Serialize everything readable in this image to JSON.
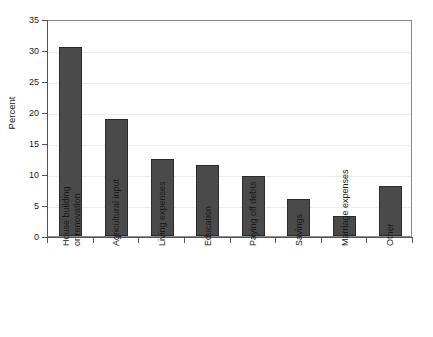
{
  "chart_data": {
    "type": "bar",
    "title": "",
    "xlabel": "",
    "ylabel": "Percent",
    "ylim": [
      0,
      35
    ],
    "yticks": [
      0,
      5,
      10,
      15,
      20,
      25,
      30,
      35
    ],
    "ytick_labels": [
      "0",
      "5",
      "10",
      "15",
      "20",
      "25",
      "30",
      "35"
    ],
    "grid": true,
    "legend": false,
    "categories": [
      "House building\nor renovation",
      "Agricultural input",
      "Living expenses",
      "Education",
      "Paying off debts",
      "Savings",
      "Marriage expenses",
      "Other"
    ],
    "values": [
      30.5,
      18.8,
      12.5,
      11.5,
      9.7,
      6.0,
      3.3,
      8.0
    ],
    "bar_color": "#4a4a4a",
    "bar_edge_color": "#2b2b2b",
    "gridline_color": "#ececec",
    "axis_color": "#555555"
  },
  "axis": {
    "y_title": "Percent"
  }
}
